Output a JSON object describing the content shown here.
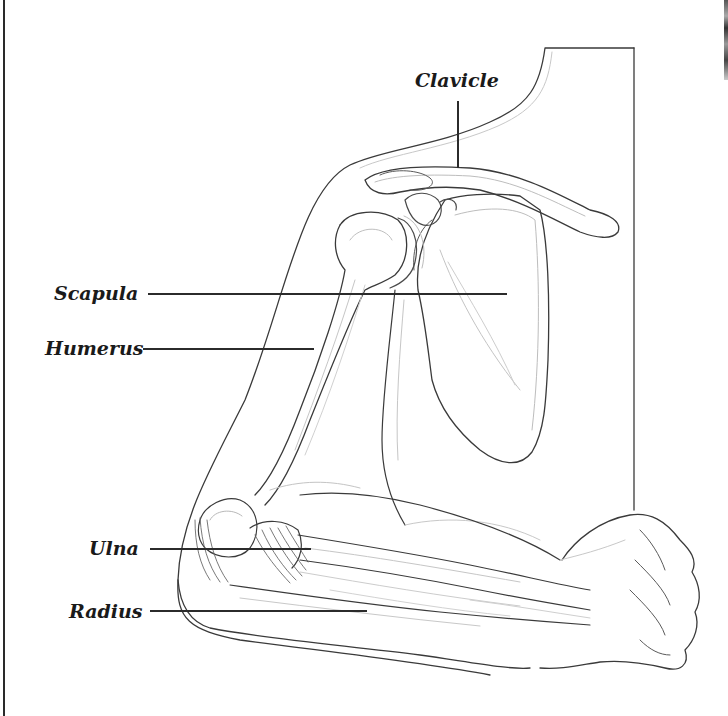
{
  "diagram": {
    "style": "black-and-white line art",
    "colors": {
      "line": "#2b2b2b",
      "light_line": "#b8b8b8",
      "label": "#1a1a1a",
      "background": "#ffffff"
    },
    "labels": [
      {
        "id": "clavicle",
        "text": "Clavicle",
        "x": 415,
        "y": 71,
        "leader": {
          "orientation": "vertical",
          "x": 458,
          "y1": 101,
          "y2": 168
        }
      },
      {
        "id": "scapula",
        "text": "Scapula",
        "x": 54,
        "y": 284,
        "leader": {
          "orientation": "horizontal",
          "y": 294,
          "x1": 148,
          "x2": 507
        }
      },
      {
        "id": "humerus",
        "text": "Humerus",
        "x": 45,
        "y": 339,
        "leader": {
          "orientation": "horizontal",
          "y": 349,
          "x1": 143,
          "x2": 314
        }
      },
      {
        "id": "ulna",
        "text": "Ulna",
        "x": 89,
        "y": 539,
        "leader": {
          "orientation": "horizontal",
          "y": 549,
          "x1": 150,
          "x2": 311
        }
      },
      {
        "id": "radius",
        "text": "Radius",
        "x": 69,
        "y": 602,
        "leader": {
          "orientation": "horizontal",
          "y": 611,
          "x1": 150,
          "x2": 367
        }
      }
    ]
  }
}
